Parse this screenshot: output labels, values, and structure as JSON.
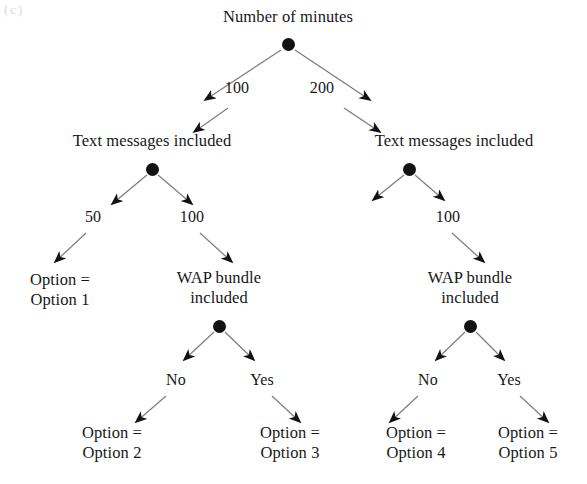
{
  "diagram": {
    "type": "decision-tree",
    "title": "Number of minutes",
    "width": 587,
    "height": 484,
    "background_color": "#ffffff",
    "ink_color": "#171717",
    "node_dot_color": "#121212",
    "corner_artifact_text": "(c)"
  },
  "nodes": [
    {
      "id": "root",
      "label": "Number of minutes",
      "label_x": 288,
      "label_y": 17,
      "dot_x": 288,
      "dot_y": 44
    },
    {
      "id": "tmi-left",
      "label": "Text messages included",
      "label_x": 152,
      "label_y": 141,
      "dot_x": 152,
      "dot_y": 169
    },
    {
      "id": "tmi-right",
      "label": "Text messages included",
      "label_x": 454,
      "label_y": 141,
      "dot_x": 409,
      "dot_y": 169
    },
    {
      "id": "wap-left",
      "label": "WAP bundle\nincluded",
      "label_x": 219,
      "label_y": 288,
      "dot_x": 219,
      "dot_y": 326
    },
    {
      "id": "wap-right",
      "label": "WAP bundle\nincluded",
      "label_x": 470,
      "label_y": 288,
      "dot_x": 470,
      "dot_y": 326
    }
  ],
  "leaves": [
    {
      "id": "leaf1",
      "label": "Option =\nOption 1",
      "x": 60,
      "y": 290
    },
    {
      "id": "leaf2",
      "label": "Option =\nOption 2",
      "x": 112,
      "y": 443
    },
    {
      "id": "leaf3",
      "label": "Option =\nOption 3",
      "x": 290,
      "y": 443
    },
    {
      "id": "leaf4",
      "label": "Option =\nOption 4",
      "x": 416,
      "y": 443
    },
    {
      "id": "leaf5",
      "label": "Option =\nOption 5",
      "x": 528,
      "y": 443
    }
  ],
  "edges": [
    {
      "id": "e-root-left",
      "from": "root",
      "to": "tmi-left",
      "label": "100",
      "label_x": 237,
      "label_y": 88,
      "seg1": [
        281,
        50,
        205,
        100
      ],
      "seg2": [
        228,
        108,
        194,
        132
      ]
    },
    {
      "id": "e-root-right",
      "from": "root",
      "to": "tmi-right",
      "label": "200",
      "label_x": 322,
      "label_y": 88,
      "seg1": [
        295,
        50,
        370,
        100
      ],
      "seg2": [
        344,
        108,
        380,
        132
      ]
    },
    {
      "id": "e-tmi-left-left",
      "from": "tmi-left",
      "to": "leaf1",
      "label": "50",
      "label_x": 93,
      "label_y": 217,
      "seg1": [
        147,
        175,
        112,
        204
      ],
      "seg2": [
        86,
        233,
        55,
        262
      ]
    },
    {
      "id": "e-tmi-left-right",
      "from": "tmi-left",
      "to": "wap-left",
      "label": "100",
      "label_x": 192,
      "label_y": 217,
      "seg1": [
        158,
        175,
        192,
        204
      ],
      "seg2": [
        200,
        233,
        232,
        262
      ]
    },
    {
      "id": "e-tmi-right-left",
      "from": "tmi-right",
      "to": "",
      "label": "",
      "label_x": 0,
      "label_y": 0,
      "seg1": [
        404,
        175,
        373,
        200
      ],
      "seg2": null
    },
    {
      "id": "e-tmi-right-right",
      "from": "tmi-right",
      "to": "wap-right",
      "label": "100",
      "label_x": 448,
      "label_y": 217,
      "seg1": [
        415,
        175,
        444,
        200
      ],
      "seg2": [
        452,
        233,
        484,
        262
      ]
    },
    {
      "id": "e-wap-left-no",
      "from": "wap-left",
      "to": "leaf2",
      "label": "No",
      "label_x": 176,
      "label_y": 380,
      "seg1": [
        214,
        332,
        184,
        360
      ],
      "seg2": [
        166,
        396,
        136,
        422
      ]
    },
    {
      "id": "e-wap-left-yes",
      "from": "wap-left",
      "to": "leaf3",
      "label": "Yes",
      "label_x": 262,
      "label_y": 380,
      "seg1": [
        225,
        332,
        254,
        360
      ],
      "seg2": [
        272,
        396,
        300,
        422
      ]
    },
    {
      "id": "e-wap-right-no",
      "from": "wap-right",
      "to": "leaf4",
      "label": "No",
      "label_x": 428,
      "label_y": 380,
      "seg1": [
        465,
        332,
        436,
        360
      ],
      "seg2": [
        418,
        396,
        390,
        422
      ]
    },
    {
      "id": "e-wap-right-yes",
      "from": "wap-right",
      "to": "leaf5",
      "label": "Yes",
      "label_x": 509,
      "label_y": 380,
      "seg1": [
        476,
        332,
        504,
        360
      ],
      "seg2": [
        520,
        396,
        548,
        422
      ]
    }
  ]
}
